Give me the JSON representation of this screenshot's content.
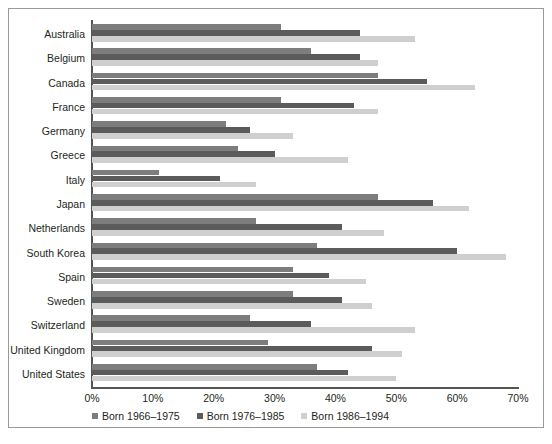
{
  "chart_data": {
    "type": "bar",
    "orientation": "horizontal",
    "title": "",
    "subtitle": "",
    "xlabel": "",
    "ylabel": "",
    "xlim": [
      0,
      70
    ],
    "xtick_labels": [
      "0%",
      "10%",
      "20%",
      "30%",
      "40%",
      "50%",
      "60%",
      "70%"
    ],
    "xtick_values": [
      0,
      10,
      20,
      30,
      40,
      50,
      60,
      70
    ],
    "grid": false,
    "legend_position": "bottom",
    "value_unit": "%",
    "categories": [
      "Australia",
      "Belgium",
      "Canada",
      "France",
      "Germany",
      "Greece",
      "Italy",
      "Japan",
      "Netherlands",
      "South Korea",
      "Spain",
      "Sweden",
      "Switzerland",
      "United Kingdom",
      "United States"
    ],
    "series": [
      {
        "name": "Born 1966–1975",
        "color": "#7d7d7d",
        "values": [
          31,
          36,
          47,
          31,
          22,
          24,
          11,
          47,
          27,
          37,
          33,
          33,
          26,
          29,
          37
        ]
      },
      {
        "name": "Born 1976–1985",
        "color": "#5b5b5b",
        "values": [
          44,
          44,
          55,
          43,
          26,
          30,
          21,
          56,
          41,
          60,
          39,
          41,
          36,
          46,
          42
        ]
      },
      {
        "name": "Born 1986–1994",
        "color": "#cfcfcf",
        "values": [
          53,
          47,
          63,
          47,
          33,
          42,
          27,
          62,
          48,
          68,
          45,
          46,
          53,
          51,
          50
        ]
      }
    ]
  }
}
